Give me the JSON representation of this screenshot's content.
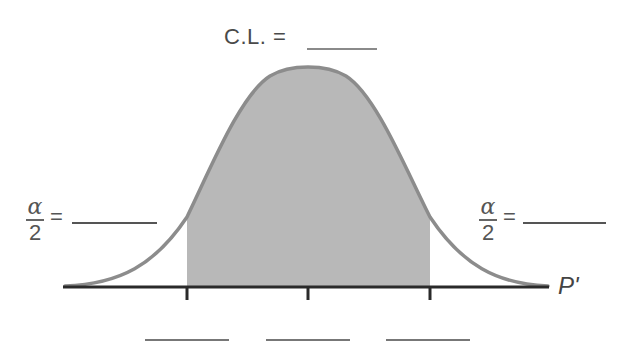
{
  "diagram": {
    "type": "normal-distribution-confidence-interval",
    "title_label": "C.L. =",
    "title_blank": "",
    "left_tail": {
      "numerator": "α",
      "denominator": "2",
      "equals": "=",
      "blank": ""
    },
    "right_tail": {
      "numerator": "α",
      "denominator": "2",
      "equals": "=",
      "blank": ""
    },
    "axis_label": "P'",
    "tick_blanks": [
      "",
      "",
      ""
    ],
    "colors": {
      "curve": "#8c8c8c",
      "shaded_area": "#b8b8b8",
      "axis": "#2a2a2a",
      "text": "#4a4a4a"
    }
  }
}
